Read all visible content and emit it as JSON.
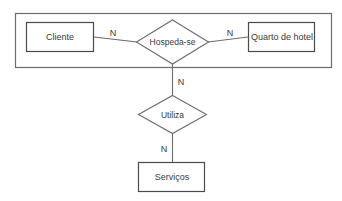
{
  "diagram": {
    "type": "entity-relationship-diagram",
    "title": "",
    "background_color": "#ffffff",
    "line_color": "#6b6b6b",
    "text_color": "#3a3a3a",
    "grouping_box": {
      "name": "outer-grouping-box",
      "x": 15,
      "y": 13,
      "width": 317,
      "height": 55
    },
    "entities": [
      {
        "id": "cliente",
        "label": "Cliente",
        "shape": "rectangle",
        "x": 26,
        "y": 22,
        "width": 68,
        "height": 30
      },
      {
        "id": "quarto-de-hotel",
        "label": "Quarto de hotel",
        "shape": "rectangle",
        "x": 248,
        "y": 22,
        "width": 67,
        "height": 30
      },
      {
        "id": "servicos",
        "label": "Serviços",
        "shape": "rectangle",
        "x": 138,
        "y": 162,
        "width": 67,
        "height": 30
      }
    ],
    "relationships": [
      {
        "id": "hospeda-se",
        "label": "Hospeda-se",
        "shape": "diamond",
        "cx": 172.5,
        "cy": 42,
        "rx": 36,
        "ry": 22
      },
      {
        "id": "utiliza",
        "label": "Utiliza",
        "shape": "diamond",
        "cx": 172.5,
        "cy": 114.5,
        "rx": 34,
        "ry": 19
      }
    ],
    "connectors": [
      {
        "id": "cliente-hospeda-se",
        "from": "cliente",
        "to": "hospeda-se",
        "cardinality": "N",
        "orientation": "horizontal",
        "label_x": 113,
        "label_y": 33
      },
      {
        "id": "hospeda-se-quarto",
        "from": "hospeda-se",
        "to": "quarto-de-hotel",
        "cardinality": "N",
        "orientation": "horizontal",
        "label_x": 230,
        "label_y": 33
      },
      {
        "id": "hospeda-se-utiliza",
        "from": "hospeda-se",
        "to": "utiliza",
        "cardinality": "N",
        "orientation": "vertical",
        "label_x": 181,
        "label_y": 82
      },
      {
        "id": "utiliza-servicos",
        "from": "utiliza",
        "to": "servicos",
        "cardinality": "N",
        "orientation": "vertical",
        "label_x": 164,
        "label_y": 149
      }
    ]
  }
}
